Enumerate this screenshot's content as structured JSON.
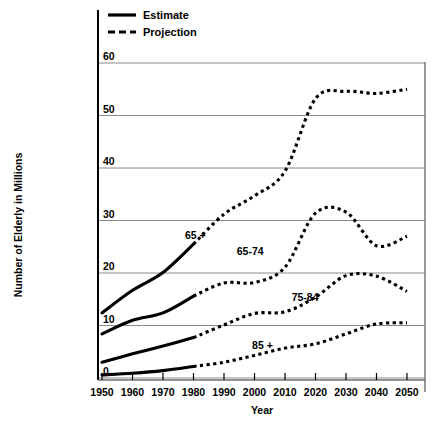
{
  "chart_data": {
    "type": "line",
    "title": "",
    "xlabel": "Year",
    "ylabel": "Number of Elderly in Millions",
    "xlim": [
      1950,
      2050
    ],
    "ylim": [
      0,
      60
    ],
    "xticks": [
      1950,
      1960,
      1970,
      1980,
      1990,
      2000,
      2010,
      2020,
      2030,
      2040,
      2050
    ],
    "yticks": [
      0,
      10,
      20,
      30,
      40,
      50,
      60
    ],
    "grid": "horizontal",
    "legend_position": "top-left",
    "legend": [
      {
        "label": "Estimate",
        "style": "solid"
      },
      {
        "label": "Projection",
        "style": "dashed"
      }
    ],
    "x": [
      1950,
      1960,
      1970,
      1980,
      1990,
      2000,
      2010,
      2020,
      2030,
      2040,
      2050
    ],
    "series": [
      {
        "name": "65 +",
        "label": "65 +",
        "estimate_x": [
          1950,
          1960,
          1970,
          1980
        ],
        "estimate_values": [
          12.4,
          16.7,
          20.1,
          25.5
        ],
        "projection_x": [
          1980,
          1990,
          2000,
          2010,
          2020,
          2030,
          2040,
          2050
        ],
        "projection_values": [
          25.5,
          31.2,
          34.7,
          39.4,
          53.2,
          54.6,
          54.2,
          55.0
        ]
      },
      {
        "name": "65-74",
        "label": "65-74",
        "estimate_x": [
          1950,
          1960,
          1970,
          1980
        ],
        "estimate_values": [
          8.4,
          11.0,
          12.4,
          15.6
        ],
        "projection_x": [
          1980,
          1990,
          2000,
          2010,
          2020,
          2030,
          2040,
          2050
        ],
        "projection_values": [
          15.6,
          18.1,
          18.2,
          21.1,
          31.4,
          31.6,
          25.2,
          27.0
        ]
      },
      {
        "name": "75-84",
        "label": "75-84",
        "estimate_x": [
          1950,
          1960,
          1970,
          1980
        ],
        "estimate_values": [
          3.0,
          4.6,
          6.1,
          7.7
        ],
        "projection_x": [
          1980,
          1990,
          2000,
          2010,
          2020,
          2030,
          2040,
          2050
        ],
        "projection_values": [
          7.7,
          10.1,
          12.3,
          12.6,
          15.4,
          19.5,
          19.4,
          16.5
        ]
      },
      {
        "name": "85 +",
        "label": "85 +",
        "estimate_x": [
          1950,
          1960,
          1970,
          1980
        ],
        "estimate_values": [
          0.6,
          0.9,
          1.4,
          2.2
        ],
        "projection_x": [
          1980,
          1990,
          2000,
          2010,
          2020,
          2030,
          2040,
          2050
        ],
        "projection_values": [
          2.2,
          3.0,
          4.3,
          5.7,
          6.5,
          8.4,
          10.3,
          10.5
        ]
      }
    ],
    "annotations": [
      {
        "text": "65 +",
        "x": 1984,
        "y": 26.5,
        "anchor": "end"
      },
      {
        "text": "65-74",
        "x": 2003,
        "y": 23.4,
        "anchor": "end"
      },
      {
        "text": "75-84",
        "x": 2021,
        "y": 14.6,
        "anchor": "end"
      },
      {
        "text": "85 +",
        "x": 2006,
        "y": 5.6,
        "anchor": "end"
      }
    ],
    "colors": {
      "line": "#000000",
      "grid": "#8a8a8a",
      "axis": "#000000",
      "background": "#ffffff"
    }
  }
}
